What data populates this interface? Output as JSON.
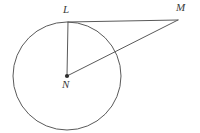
{
  "figure": {
    "kind": "circle-tangent-geometry-diagram",
    "background_color": "#ffffff",
    "stroke_color": "#5a5a5a",
    "label_color": "#3a3a3a",
    "stroke_width": 1,
    "width": 200,
    "height": 133
  },
  "points": {
    "L": {
      "label": "L",
      "x": 68,
      "y": 22,
      "role": "tangent-point-on-circle"
    },
    "M": {
      "label": "M",
      "x": 178,
      "y": 20,
      "role": "external-point"
    },
    "N": {
      "label": "N",
      "x": 67,
      "y": 76,
      "role": "circle-center",
      "marker": "filled-dot"
    }
  },
  "circle": {
    "name": "circle-N",
    "center_x": 67,
    "center_y": 76,
    "radius": 54
  },
  "segments": [
    {
      "name": "segment-NL",
      "from": "N",
      "to": "L",
      "x1": 67,
      "y1": 76,
      "x2": 68,
      "y2": 22,
      "role": "radius"
    },
    {
      "name": "segment-LM",
      "from": "L",
      "to": "M",
      "x1": 68,
      "y1": 22,
      "x2": 178,
      "y2": 20,
      "role": "tangent"
    },
    {
      "name": "segment-NM",
      "from": "N",
      "to": "M",
      "x1": 67,
      "y1": 76,
      "x2": 178,
      "y2": 20,
      "role": "secant-hypotenuse"
    }
  ],
  "labels": {
    "L": "L",
    "M": "M",
    "N": "N"
  }
}
